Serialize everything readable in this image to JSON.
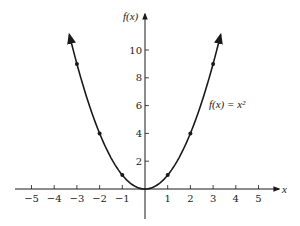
{
  "chart_data": {
    "type": "line",
    "title": "",
    "xlabel": "x",
    "ylabel": "f(x)",
    "function_label": "f(x) = x²",
    "xlim": [
      -5.5,
      5.5
    ],
    "ylim": [
      -2,
      12
    ],
    "x_ticks": [
      -5,
      -4,
      -3,
      -2,
      -1,
      1,
      2,
      3,
      4,
      5
    ],
    "x_tick_labels": [
      "−5",
      "−4",
      "−3",
      "−2",
      "−1",
      "1",
      "2",
      "3",
      "4",
      "5"
    ],
    "y_ticks": [
      2,
      4,
      6,
      8,
      10
    ],
    "y_tick_labels": [
      "2",
      "4",
      "6",
      "8",
      "10"
    ],
    "grid": false,
    "legend": null,
    "series": [
      {
        "name": "f(x) = x²",
        "curve_domain": [
          -3.33,
          3.33
        ],
        "arrows_at_ends": true,
        "points": [
          {
            "x": -3,
            "y": 9
          },
          {
            "x": -2,
            "y": 4
          },
          {
            "x": -1,
            "y": 1
          },
          {
            "x": 0,
            "y": 0
          },
          {
            "x": 1,
            "y": 1
          },
          {
            "x": 2,
            "y": 4
          },
          {
            "x": 3,
            "y": 9
          }
        ]
      }
    ],
    "color": "#1a1a1a"
  }
}
